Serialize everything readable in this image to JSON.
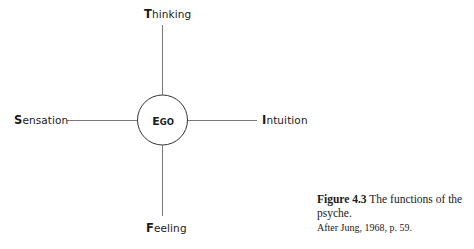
{
  "diagram": {
    "center": {
      "label_initial": "E",
      "label_rest": "GO"
    },
    "functions": {
      "top": {
        "initial": "T",
        "rest": "hinking"
      },
      "bottom": {
        "initial": "F",
        "rest": "eeling"
      },
      "left": {
        "initial": "S",
        "rest": "ensation"
      },
      "right": {
        "initial": "I",
        "rest": "ntuition"
      }
    },
    "colors": {
      "line": "#777777",
      "circle": "#333333",
      "text": "#1a1a1a"
    }
  },
  "caption": {
    "figure_number": "Figure 4.3",
    "title": " The functions of the psyche.",
    "source": "After Jung, 1968, p. 59."
  }
}
